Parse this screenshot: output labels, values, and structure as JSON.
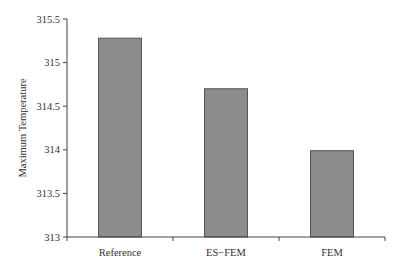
{
  "chart_data": {
    "type": "bar",
    "title": "",
    "xlabel": "",
    "ylabel": "Maximum Temperature",
    "categories": [
      "Reference",
      "ES−FEM",
      "FEM"
    ],
    "values": [
      315.28,
      314.7,
      313.99
    ],
    "ylim": [
      313,
      315.5
    ],
    "yticks": [
      "313",
      "313.5",
      "314",
      "314.5",
      "315",
      "315.5"
    ],
    "grid": false,
    "legend": null,
    "colors": {
      "bar_fill": "#8c8c8c",
      "bar_stroke": "#555555",
      "axis": "#444444"
    }
  }
}
